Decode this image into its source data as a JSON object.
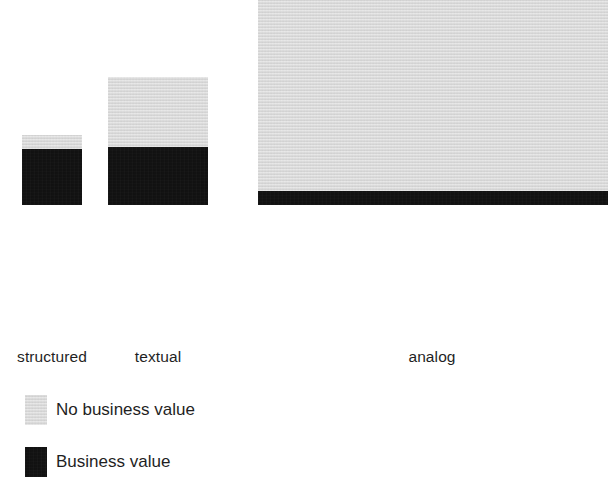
{
  "chart_data": {
    "type": "bar",
    "title": "",
    "subtitle": "",
    "xlabel": "",
    "ylabel": "",
    "stacked": true,
    "grid": false,
    "legend_position": "bottom-left",
    "axis_visible": false,
    "ylim": [
      0,
      340
    ],
    "categories": [
      "structured",
      "textual",
      "analog"
    ],
    "series": [
      {
        "name": "Business value",
        "color": "#0d0d0d",
        "values": [
          56,
          58,
          14
        ]
      },
      {
        "name": "No business value",
        "color": "#dddddd",
        "values": [
          14,
          70,
          323
        ]
      }
    ],
    "totals": [
      70,
      128,
      337
    ],
    "note": "Heights read in pixels off the shared baseline; the analog bar is clipped by the right edge of the figure."
  },
  "figure": {
    "baseline_y": 341,
    "bars": [
      {
        "category": "structured",
        "left": 22,
        "width": 60,
        "business_value_height": 56,
        "no_business_value_height": 14,
        "label": "structured",
        "label_left": 0,
        "label_width": 104
      },
      {
        "category": "textual",
        "left": 108,
        "width": 100,
        "business_value_height": 58,
        "no_business_value_height": 70,
        "label": "textual",
        "label_left": 120,
        "label_width": 76
      },
      {
        "category": "analog",
        "left": 258,
        "width": 350,
        "business_value_height": 14,
        "no_business_value_height": 323,
        "label": "analog",
        "label_left": 378,
        "label_width": 108
      }
    ]
  },
  "legend": {
    "items": [
      {
        "label": "No business value",
        "color": "#dddddd",
        "swatch": "grey-swatch"
      },
      {
        "label": "Business value",
        "color": "#0d0d0d",
        "swatch": "black-swatch"
      }
    ]
  }
}
